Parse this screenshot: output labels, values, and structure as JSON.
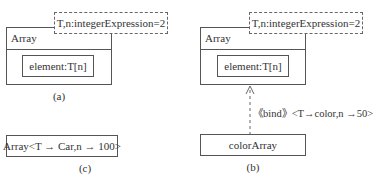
{
  "diagram_a": {
    "class_name": "Array",
    "template_params": "T,n:integerExpression=2",
    "attribute": "element:T[n]",
    "caption": "(a)"
  },
  "diagram_b": {
    "class_name": "Array",
    "template_params": "T,n:integerExpression=2",
    "attribute": "element:T[n]",
    "binding_label": "《bind》<T→color,n →50>",
    "bound_class": "colorArray",
    "caption": "(b)"
  },
  "diagram_c": {
    "bound_class": "Array<T → Car,n → 100>",
    "caption": "(c)"
  }
}
